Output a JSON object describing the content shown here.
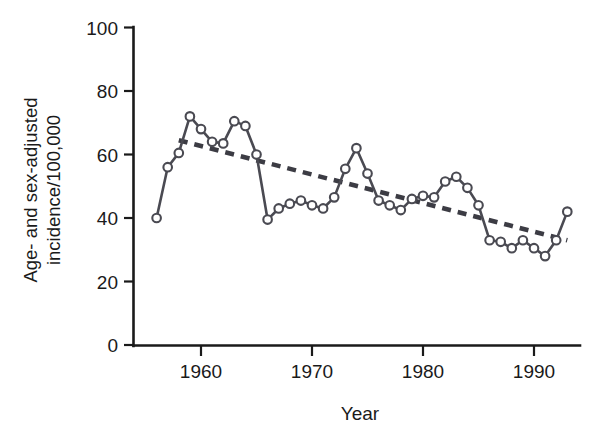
{
  "chart_data": {
    "type": "line",
    "title": "",
    "xlabel": "Year",
    "ylabel": "Age- and sex-adjusted incidence/100,000",
    "ylabel_line1": "Age- and sex-adjusted",
    "ylabel_line2": "incidence/100,000",
    "xlim": [
      1955.3,
      1994.0
    ],
    "ylim": [
      0,
      100
    ],
    "grid": false,
    "legend": null,
    "y_ticks": [
      0,
      20,
      40,
      60,
      80,
      100
    ],
    "y_tick_labels": [
      "0",
      "20",
      "40",
      "60",
      "80",
      "100"
    ],
    "x_ticks": [
      1960,
      1970,
      1980,
      1990
    ],
    "x_tick_labels": [
      "1960",
      "1970",
      "1980",
      "1990"
    ],
    "x": [
      1956,
      1957,
      1958,
      1959,
      1960,
      1961,
      1962,
      1963,
      1964,
      1965,
      1966,
      1967,
      1968,
      1969,
      1970,
      1971,
      1972,
      1973,
      1974,
      1975,
      1976,
      1977,
      1978,
      1979,
      1980,
      1981,
      1982,
      1983,
      1984,
      1985,
      1986,
      1987,
      1988,
      1989,
      1990,
      1991,
      1992,
      1993
    ],
    "series": [
      {
        "name": "Age- and sex-adjusted incidence",
        "marker": "open-circle",
        "color": "#4a4a52",
        "values": [
          40.0,
          56.0,
          60.5,
          72.0,
          68.0,
          64.0,
          63.5,
          70.5,
          69.0,
          60.0,
          39.5,
          43.0,
          44.5,
          45.5,
          44.0,
          43.0,
          46.5,
          55.5,
          62.0,
          54.0,
          45.5,
          44.0,
          42.5,
          46.0,
          47.0,
          46.5,
          51.5,
          53.0,
          49.5,
          44.0,
          33.0,
          32.5,
          30.5,
          33.0,
          30.5,
          28.0,
          33.0,
          42.0
        ]
      }
    ],
    "trend_line": {
      "name": "linear trend",
      "style": "dashed",
      "color": "#3c3c44",
      "x_start": 1958.0,
      "y_start": 64.5,
      "x_end": 1993.0,
      "y_end": 33.0
    }
  }
}
